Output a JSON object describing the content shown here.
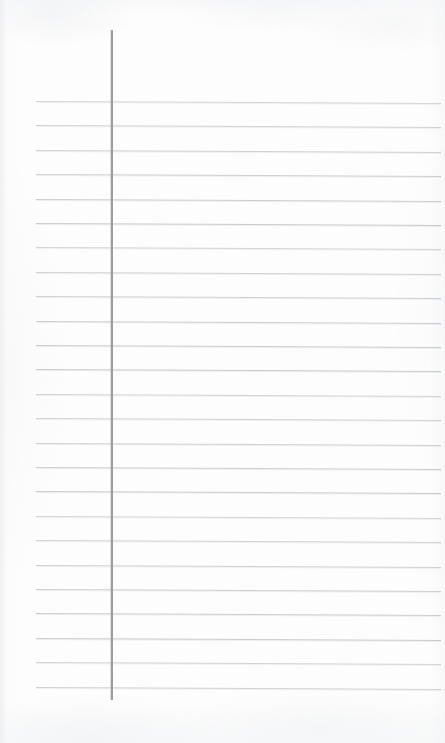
{
  "page": {
    "kind": "lined-notebook-page",
    "width": 445,
    "height": 743,
    "background_color": "#fdfdfd",
    "content_text": "",
    "status_text": ""
  },
  "ruling": {
    "rule_color": "#c8cacc",
    "margin_rule_color": "#9b9d9f",
    "line_count": 25,
    "first_line_y": 101,
    "line_spacing": 24.4,
    "line_start_x": 36,
    "line_end_x": 441,
    "tilt_degrees": 0.28,
    "lines_y": [
      101,
      125.4,
      149.8,
      174.2,
      198.6,
      223,
      247.4,
      271.8,
      296.2,
      320.6,
      345,
      369.4,
      393.8,
      418.2,
      442.6,
      467,
      491.4,
      515.8,
      540.2,
      564.6,
      589,
      613.4,
      637.8,
      662.2,
      686.6
    ]
  },
  "margin_rule": {
    "x": 111,
    "top_y": 30,
    "bottom_y": 700,
    "width": 1.6
  },
  "regions": {
    "left_margin_label": "left-margin-column",
    "body_label": "writing-body-column",
    "header_label": "header-blank-area",
    "footer_label": "footer-blank-area"
  }
}
